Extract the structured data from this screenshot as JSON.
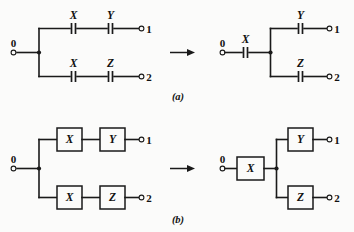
{
  "figure": {
    "background_color": "#fbfbfa",
    "line_color": "#1a1a1a",
    "panels": [
      {
        "id": "a",
        "caption": "(a)",
        "element_style": "capacitor",
        "left_circuit": {
          "input_port": "0",
          "branches": [
            {
              "elements": [
                "X",
                "Y"
              ],
              "output_port": "1"
            },
            {
              "elements": [
                "X",
                "Z"
              ],
              "output_port": "2"
            }
          ]
        },
        "transform_arrow": "→",
        "right_circuit": {
          "input_port": "0",
          "shared_elements": [
            "X"
          ],
          "branches": [
            {
              "elements": [
                "Y"
              ],
              "output_port": "1"
            },
            {
              "elements": [
                "Z"
              ],
              "output_port": "2"
            }
          ]
        }
      },
      {
        "id": "b",
        "caption": "(b)",
        "element_style": "block",
        "left_circuit": {
          "input_port": "0",
          "branches": [
            {
              "elements": [
                "X",
                "Y"
              ],
              "output_port": "1"
            },
            {
              "elements": [
                "X",
                "Z"
              ],
              "output_port": "2"
            }
          ]
        },
        "transform_arrow": "→",
        "right_circuit": {
          "input_port": "0",
          "shared_elements": [
            "X"
          ],
          "branches": [
            {
              "elements": [
                "Y"
              ],
              "output_port": "1"
            },
            {
              "elements": [
                "Z"
              ],
              "output_port": "2"
            }
          ]
        }
      }
    ],
    "labels": {
      "a_l_top_1": "X",
      "a_l_top_2": "Y",
      "a_l_bot_1": "X",
      "a_l_bot_2": "Z",
      "a_l_in": "0",
      "a_l_out_top": "1",
      "a_l_out_bot": "2",
      "a_r_shared": "X",
      "a_r_top": "Y",
      "a_r_bot": "Z",
      "a_r_in": "0",
      "a_r_out_top": "1",
      "a_r_out_bot": "2",
      "caption_a": "(a)",
      "b_l_top_1": "X",
      "b_l_top_2": "Y",
      "b_l_bot_1": "X",
      "b_l_bot_2": "Z",
      "b_l_in": "0",
      "b_l_out_top": "1",
      "b_l_out_bot": "2",
      "b_r_shared": "X",
      "b_r_top": "Y",
      "b_r_bot": "Z",
      "b_r_in": "0",
      "b_r_out_top": "1",
      "b_r_out_bot": "2",
      "caption_b": "(b)"
    }
  }
}
